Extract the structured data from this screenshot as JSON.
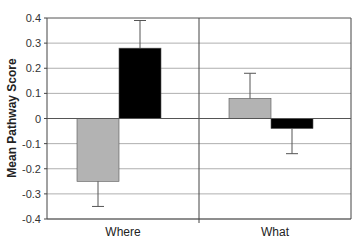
{
  "chart_data": {
    "type": "bar",
    "title": "",
    "xlabel": "",
    "ylabel": "Mean Pathway Score",
    "ylim": [
      -0.4,
      0.4
    ],
    "yticks": [
      "0.4",
      "0.3",
      "0.2",
      "0.1",
      "0",
      "-0.1",
      "-0.2",
      "-0.3",
      "-0.4"
    ],
    "grid": true,
    "legend": null,
    "categories": [
      "Where",
      "What"
    ],
    "series": [
      {
        "name": "gray",
        "color": "#b3b3b3",
        "values": [
          -0.25,
          0.08
        ],
        "error_upper": [
          -0.25,
          0.18
        ],
        "error_lower": [
          -0.35,
          0.08
        ]
      },
      {
        "name": "black",
        "color": "#000000",
        "values": [
          0.28,
          -0.04
        ],
        "error_upper": [
          0.39,
          -0.04
        ],
        "error_lower": [
          0.28,
          -0.14
        ]
      }
    ],
    "errors": [
      [
        0.1,
        0.1
      ],
      [
        0.11,
        0.1
      ]
    ]
  }
}
